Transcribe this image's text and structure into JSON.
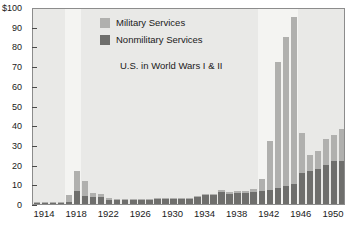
{
  "chart_data": {
    "type": "bar",
    "stacked": true,
    "title": "",
    "annotation": "U.S. in World Wars I & II",
    "xlabel": "",
    "ylabel": "",
    "ylim": [
      0,
      100
    ],
    "y_top_label": "$100",
    "grid": false,
    "legend_position": "top-center",
    "y_ticks": [
      0,
      10,
      20,
      30,
      40,
      50,
      60,
      70,
      80,
      90,
      100
    ],
    "y_tick_labels": [
      "0",
      "10",
      "20",
      "30",
      "40",
      "50",
      "60",
      "70",
      "80",
      "90",
      "$100"
    ],
    "x_tick_labels": [
      "1914",
      "1918",
      "1922",
      "1926",
      "1930",
      "1934",
      "1938",
      "1942",
      "1946",
      "1950"
    ],
    "x_tick_years": [
      1914,
      1918,
      1922,
      1926,
      1930,
      1934,
      1938,
      1942,
      1946,
      1950
    ],
    "x_range": [
      1913,
      1951
    ],
    "categories": [
      1913,
      1914,
      1915,
      1916,
      1917,
      1918,
      1919,
      1920,
      1921,
      1922,
      1923,
      1924,
      1925,
      1926,
      1927,
      1928,
      1929,
      1930,
      1931,
      1932,
      1933,
      1934,
      1935,
      1936,
      1937,
      1938,
      1939,
      1940,
      1941,
      1942,
      1943,
      1944,
      1945,
      1946,
      1947,
      1948,
      1949,
      1950,
      1951
    ],
    "series": [
      {
        "name": "Nonmilitary Services",
        "color": "#6e6e6c",
        "values": [
          0.5,
          0.5,
          0.5,
          0.5,
          0.9,
          6.8,
          4.2,
          3.6,
          3.5,
          2.2,
          2.1,
          2.1,
          2.1,
          2.1,
          2.2,
          2.3,
          2.3,
          2.4,
          2.6,
          2.6,
          3.4,
          4.4,
          4.6,
          6.0,
          5.1,
          5.4,
          5.6,
          6.1,
          6.5,
          7.2,
          8.1,
          9.0,
          10.0,
          15.5,
          17.0,
          18.0,
          20.0,
          22.0,
          22.0
        ]
      },
      {
        "name": "Military Services",
        "color": "#b0b0ae",
        "values": [
          0.3,
          0.3,
          0.3,
          0.3,
          3.5,
          10.0,
          7.6,
          2.0,
          1.5,
          0.9,
          0.7,
          0.7,
          0.6,
          0.6,
          0.6,
          0.7,
          0.7,
          0.7,
          0.7,
          0.7,
          0.6,
          0.7,
          0.7,
          0.9,
          0.9,
          1.0,
          1.2,
          1.7,
          6.3,
          24.6,
          64.0,
          76.0,
          85.0,
          20.5,
          8.0,
          9.0,
          13.0,
          13.0,
          16.0
        ]
      }
    ],
    "war_bands": [
      {
        "name": "World War I",
        "start": 1917,
        "end": 1918
      },
      {
        "name": "World War II",
        "start": 1941,
        "end": 1945
      }
    ]
  },
  "legend": {
    "items": [
      {
        "label": "Military Services",
        "color": "#b0b0ae"
      },
      {
        "label": "Nonmilitary Services",
        "color": "#6e6e6c"
      }
    ]
  },
  "colors": {
    "military": "#b0b0ae",
    "nonmilitary": "#6e6e6c",
    "plot_background": "#e9e9e7",
    "war_band": "#f4f4f2",
    "axis": "#4a4a4a",
    "text": "#1a1a1a"
  }
}
